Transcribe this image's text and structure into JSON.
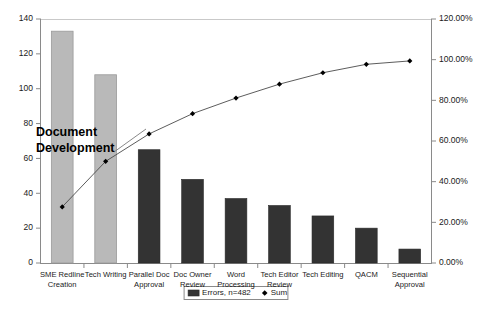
{
  "chart_data": {
    "type": "bar",
    "title": "",
    "subtitle": "",
    "xlabel": "",
    "ylabel": "",
    "y2label": "",
    "grid": false,
    "legend_position": "bottom",
    "categories": [
      "SME Redline Creation",
      "Tech Writing",
      "Parallel Doc Approval",
      "Doc Owner Review",
      "Word Processing",
      "Tech Editor Review",
      "Tech Editing",
      "QACM",
      "Sequential Approval"
    ],
    "category_lines": [
      [
        "SME Redline",
        "Creation"
      ],
      [
        "Tech Writing"
      ],
      [
        "Parallel Doc",
        "Approval"
      ],
      [
        "Doc Owner",
        "Review"
      ],
      [
        "Word",
        "Processing"
      ],
      [
        "Tech Editor",
        "Review"
      ],
      [
        "Tech Editing"
      ],
      [
        "QACM"
      ],
      [
        "Sequential",
        "Approval"
      ]
    ],
    "series": [
      {
        "name": "Errors, n=482",
        "type": "bar",
        "axis": "left",
        "values": [
          133,
          108,
          65,
          48,
          37,
          33,
          27,
          20,
          8
        ]
      },
      {
        "name": "Sum",
        "type": "line",
        "axis": "right",
        "values": [
          27.6,
          50.0,
          63.48,
          73.44,
          81.12,
          87.97,
          93.57,
          97.72,
          99.38
        ]
      }
    ],
    "ylim": [
      0,
      140
    ],
    "yticks": [
      0,
      20,
      40,
      60,
      80,
      100,
      120,
      140
    ],
    "ytick_labels": [
      "0",
      "20",
      "40",
      "60",
      "80",
      "100",
      "120",
      "140"
    ],
    "y2lim": [
      0,
      120
    ],
    "y2ticks": [
      0,
      20,
      40,
      60,
      80,
      100,
      120
    ],
    "y2tick_labels": [
      "0.00%",
      "20.00%",
      "40.00%",
      "60.00%",
      "80.00%",
      "100.00%",
      "120.00%"
    ],
    "annotations": [
      {
        "text_lines": [
          "Document",
          "Development"
        ],
        "text": "Document Development"
      }
    ],
    "legend": [
      {
        "label": "Errors, n=482",
        "marker": "bar-swatch"
      },
      {
        "label": "Sum",
        "marker": "diamond"
      }
    ],
    "colors": {
      "highlight_bar": "#b9b9b9",
      "bar": "#333333",
      "line": "#4a4a4a",
      "marker": "#000000",
      "axis": "#8a8a8a",
      "text": "#1a1a1a",
      "background": "#ffffff"
    }
  }
}
